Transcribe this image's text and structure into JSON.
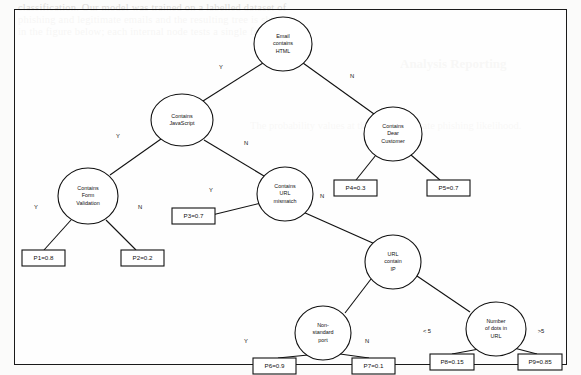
{
  "figure": {
    "type": "decision-tree",
    "background_page_text": {
      "line1": "classification. Our model was trained on a labelled dataset of",
      "line2": "phishing and legitimate emails and the resulting tree is shown",
      "line3": "in the figure below; each internal node tests a single feature.",
      "heading": "Analysis Reporting",
      "body": "The probability values at the leaves indicate phishing likelihood."
    }
  },
  "nodes": [
    {
      "id": "n1",
      "label_lines": [
        "Email",
        "contains",
        "HTML"
      ],
      "cx": 283,
      "cy": 44,
      "rx": 29,
      "ry": 27
    },
    {
      "id": "n2",
      "label_lines": [
        "Contains",
        "JavaScript"
      ],
      "cx": 182,
      "cy": 120,
      "rx": 31,
      "ry": 26
    },
    {
      "id": "n3",
      "label_lines": [
        "Contains",
        "Dear",
        "Customer"
      ],
      "cx": 393,
      "cy": 134,
      "rx": 29,
      "ry": 27
    },
    {
      "id": "n4",
      "label_lines": [
        "Contains",
        "Form",
        "Validation"
      ],
      "cx": 88,
      "cy": 196,
      "rx": 30,
      "ry": 28
    },
    {
      "id": "n5",
      "label_lines": [
        "Contains",
        "URL",
        "mismatch"
      ],
      "cx": 285,
      "cy": 194,
      "rx": 28,
      "ry": 27
    },
    {
      "id": "n6",
      "label_lines": [
        "URL",
        "contain",
        "IP"
      ],
      "cx": 393,
      "cy": 262,
      "rx": 28,
      "ry": 27
    },
    {
      "id": "n7",
      "label_lines": [
        "Non-",
        "standard",
        "port"
      ],
      "cx": 323,
      "cy": 333,
      "rx": 28,
      "ry": 27
    },
    {
      "id": "n8",
      "label_lines": [
        "Number",
        "of dots in",
        "URL"
      ],
      "cx": 496,
      "cy": 329,
      "rx": 30,
      "ry": 27
    }
  ],
  "leaves": [
    {
      "id": "l1",
      "label": "P1=0.8",
      "x": 22,
      "y": 250,
      "w": 43,
      "h": 16
    },
    {
      "id": "l2",
      "label": "P2=0.2",
      "x": 121,
      "y": 250,
      "w": 43,
      "h": 16
    },
    {
      "id": "l3",
      "label": "P3=0.7",
      "x": 172,
      "y": 208,
      "w": 43,
      "h": 16
    },
    {
      "id": "l4",
      "label": "P4=0.3",
      "x": 334,
      "y": 180,
      "w": 43,
      "h": 16
    },
    {
      "id": "l5",
      "label": "P5=0.7",
      "x": 427,
      "y": 180,
      "w": 43,
      "h": 16
    },
    {
      "id": "l6",
      "label": "P6=0.9",
      "x": 253,
      "y": 358,
      "w": 43,
      "h": 16
    },
    {
      "id": "l7",
      "label": "P7=0.1",
      "x": 352,
      "y": 358,
      "w": 43,
      "h": 16
    },
    {
      "id": "l8",
      "label": "P8=0.15",
      "x": 430,
      "y": 354,
      "w": 44,
      "h": 16
    },
    {
      "id": "l9",
      "label": "P9=0.85",
      "x": 518,
      "y": 354,
      "w": 44,
      "h": 16
    }
  ],
  "edges": [
    {
      "from": "n1",
      "to": "n2",
      "x1": 263,
      "y1": 63,
      "x2": 203,
      "y2": 101,
      "label": "Y",
      "lx": 221,
      "ly": 67
    },
    {
      "from": "n1",
      "to": "n3",
      "x1": 303,
      "y1": 63,
      "x2": 374,
      "y2": 114,
      "label": "N",
      "lx": 352,
      "ly": 76
    },
    {
      "from": "n2",
      "to": "n4",
      "x1": 161,
      "y1": 139,
      "x2": 110,
      "y2": 175,
      "label": "Y",
      "lx": 118,
      "ly": 136
    },
    {
      "from": "n2",
      "to": "n5",
      "x1": 204,
      "y1": 140,
      "x2": 264,
      "y2": 176,
      "label": "N",
      "lx": 246,
      "ly": 143
    },
    {
      "from": "n4",
      "to": "l1",
      "x1": 71,
      "y1": 220,
      "x2": 44,
      "y2": 250,
      "label": "Y",
      "lx": 36,
      "ly": 207
    },
    {
      "from": "n4",
      "to": "l2",
      "x1": 106,
      "y1": 220,
      "x2": 136,
      "y2": 250,
      "label": "N",
      "lx": 140,
      "ly": 207
    },
    {
      "from": "n5",
      "to": "l3",
      "x1": 261,
      "y1": 203,
      "x2": 212,
      "y2": 215,
      "label": "Y",
      "lx": 211,
      "ly": 190
    },
    {
      "from": "n5",
      "to": "n6",
      "x1": 303,
      "y1": 212,
      "x2": 375,
      "y2": 244,
      "label": "N",
      "lx": 322,
      "ly": 196
    },
    {
      "from": "n3",
      "to": "l4",
      "x1": 376,
      "y1": 155,
      "x2": 356,
      "y2": 180,
      "label": "",
      "lx": 0,
      "ly": 0
    },
    {
      "from": "n3",
      "to": "l5",
      "x1": 411,
      "y1": 155,
      "x2": 440,
      "y2": 180,
      "label": "",
      "lx": 0,
      "ly": 0
    },
    {
      "from": "n6",
      "to": "n7",
      "x1": 371,
      "y1": 279,
      "x2": 345,
      "y2": 313,
      "label": "",
      "lx": 0,
      "ly": 0
    },
    {
      "from": "n6",
      "to": "n8",
      "x1": 417,
      "y1": 276,
      "x2": 470,
      "y2": 312,
      "label": "",
      "lx": 0,
      "ly": 0
    },
    {
      "from": "n7",
      "to": "l6",
      "x1": 308,
      "y1": 355,
      "x2": 278,
      "y2": 358,
      "label": "Y",
      "lx": 246,
      "ly": 341
    },
    {
      "from": "n7",
      "to": "l7",
      "x1": 340,
      "y1": 354,
      "x2": 369,
      "y2": 358,
      "label": "N",
      "lx": 367,
      "ly": 341
    },
    {
      "from": "n8",
      "to": "l8",
      "x1": 479,
      "y1": 349,
      "x2": 452,
      "y2": 354,
      "label": "< 5",
      "lx": 427,
      "ly": 331
    },
    {
      "from": "n8",
      "to": "l9",
      "x1": 514,
      "y1": 348,
      "x2": 537,
      "y2": 354,
      "label": ">5",
      "lx": 541,
      "ly": 331
    }
  ]
}
